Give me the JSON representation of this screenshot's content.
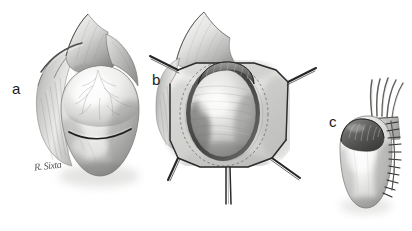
{
  "figure": {
    "medium": "grayscale pencil and airbrush medical illustration",
    "background_color": "#ffffff",
    "width": 412,
    "height": 231,
    "artist_signature": "R. Sixta",
    "panels": [
      {
        "id": "a",
        "label": "a",
        "label_x": 18,
        "label_y": 88,
        "caption": "Testis within intact tunica vaginalis with scrotal tissue flaps reflected; transverse incision line marked across the tunica.",
        "features": [
          "scrotal wall flap reflected superiorly",
          "dartos / cremasteric tissue fanning left",
          "ovoid testis covered by glistening tunica vaginalis",
          "fine surface vasculature over tunica",
          "dark transverse incision line across mid-tunica"
        ]
      },
      {
        "id": "b",
        "label": "b",
        "label_x": 158,
        "label_y": 80,
        "caption": "Scrotal incision opened and held by four stay sutures; the testis delivered into the wound with epididymis visible at its superior pole.",
        "features": [
          "reflected scrotal flap superiorly",
          "four stay-suture arms retracting the wound edges",
          "dark oval rim of incised tunica vaginalis",
          "exposed testis parenchyma with striations",
          "epididymis arching over the upper pole",
          "paired suture tails trailing inferiorly"
        ]
      },
      {
        "id": "c",
        "label": "c",
        "label_x": 335,
        "label_y": 122,
        "caption": "Completed repair: testis with epididymis and spermatic cord, closed with a continuous running suture line along the lateral border.",
        "features": [
          "spermatic cord fibers ascending superiorly",
          "dark epididymis capping the superior pole",
          "smooth pale testis body",
          "running interrupted suture line down the lateral edge"
        ]
      }
    ],
    "palette": {
      "background": "#ffffff",
      "ink_dark": "#1c1c1c",
      "shadow_deep": "#4a4a4a",
      "mid_gray": "#8f8f8f",
      "light_gray": "#c9c9c9",
      "highlight": "#f2f2f2",
      "tissue_pale": "#e4e4e2",
      "suture_line": "#2b2b2b"
    }
  }
}
